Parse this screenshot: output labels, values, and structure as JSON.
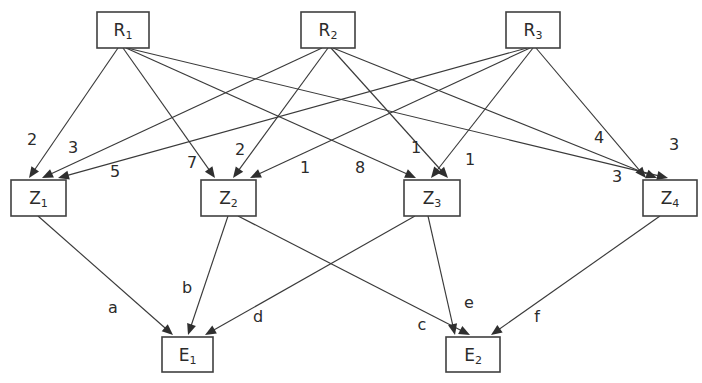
{
  "diagram": {
    "canvas": {
      "width": 702,
      "height": 383
    },
    "colors": {
      "background": "#ffffff",
      "node_stroke": "#404040",
      "node_fill": "#ffffff",
      "edge": "#3a3a3a",
      "text": "#2b2b2b"
    },
    "nodes": [
      {
        "id": "R1",
        "base": "R",
        "sub": "1",
        "layer": "input",
        "x": 97,
        "y": 12,
        "w": 52,
        "h": 36
      },
      {
        "id": "R2",
        "base": "R",
        "sub": "2",
        "layer": "input",
        "x": 301,
        "y": 12,
        "w": 54,
        "h": 36
      },
      {
        "id": "R3",
        "base": "R",
        "sub": "3",
        "layer": "input",
        "x": 506,
        "y": 12,
        "w": 54,
        "h": 36
      },
      {
        "id": "Z1",
        "base": "Z",
        "sub": "1",
        "layer": "hidden",
        "x": 11,
        "y": 180,
        "w": 55,
        "h": 36
      },
      {
        "id": "Z2",
        "base": "Z",
        "sub": "2",
        "layer": "hidden",
        "x": 201,
        "y": 180,
        "w": 55,
        "h": 36
      },
      {
        "id": "Z3",
        "base": "Z",
        "sub": "3",
        "layer": "hidden",
        "x": 404,
        "y": 180,
        "w": 56,
        "h": 36
      },
      {
        "id": "Z4",
        "base": "Z",
        "sub": "4",
        "layer": "hidden",
        "x": 643,
        "y": 180,
        "w": 54,
        "h": 36
      },
      {
        "id": "E1",
        "base": "E",
        "sub": "1",
        "layer": "output",
        "x": 162,
        "y": 337,
        "w": 51,
        "h": 35
      },
      {
        "id": "E2",
        "base": "E",
        "sub": "2",
        "layer": "output",
        "x": 446,
        "y": 337,
        "w": 54,
        "h": 35
      }
    ],
    "edges": [
      {
        "from": "R1",
        "to": "Z1",
        "label": "2",
        "x1": 118,
        "y1": 48,
        "x2": 29,
        "y2": 178,
        "lx": 32,
        "ly": 140
      },
      {
        "from": "R1",
        "to": "Z2",
        "label": "7",
        "x1": 123,
        "y1": 48,
        "x2": 215,
        "y2": 178,
        "lx": 192,
        "ly": 163
      },
      {
        "from": "R1",
        "to": "Z3",
        "label": "1",
        "x1": 126,
        "y1": 48,
        "x2": 416,
        "y2": 178,
        "lx": 416,
        "ly": 148
      },
      {
        "from": "R1",
        "to": "Z4",
        "label": "3",
        "x1": 127,
        "y1": 48,
        "x2": 668,
        "y2": 178,
        "lx": 674,
        "ly": 145
      },
      {
        "from": "R2",
        "to": "Z1",
        "label": "3",
        "x1": 322,
        "y1": 48,
        "x2": 42,
        "y2": 178,
        "lx": 73,
        "ly": 148
      },
      {
        "from": "R2",
        "to": "Z2",
        "label": "2",
        "x1": 328,
        "y1": 48,
        "x2": 233,
        "y2": 178,
        "lx": 240,
        "ly": 150
      },
      {
        "from": "R2",
        "to": "Z3",
        "label": "1",
        "x1": 331,
        "y1": 48,
        "x2": 448,
        "y2": 178,
        "lx": 470,
        "ly": 160
      },
      {
        "from": "R2",
        "to": "Z4",
        "label": "4",
        "x1": 333,
        "y1": 48,
        "x2": 657,
        "y2": 178,
        "lx": 599,
        "ly": 138
      },
      {
        "from": "R3",
        "to": "Z1",
        "label": "5",
        "x1": 527,
        "y1": 48,
        "x2": 58,
        "y2": 178,
        "lx": 115,
        "ly": 172
      },
      {
        "from": "R3",
        "to": "Z2",
        "label": "1",
        "x1": 530,
        "y1": 48,
        "x2": 250,
        "y2": 178,
        "lx": 305,
        "ly": 168
      },
      {
        "from": "R3",
        "to": "Z3",
        "label": "8",
        "x1": 533,
        "y1": 48,
        "x2": 431,
        "y2": 178,
        "lx": 360,
        "ly": 168
      },
      {
        "from": "R3",
        "to": "Z4",
        "label": "3",
        "x1": 536,
        "y1": 48,
        "x2": 646,
        "y2": 178,
        "lx": 617,
        "ly": 177
      },
      {
        "from": "Z1",
        "to": "E1",
        "label": "a",
        "x1": 38,
        "y1": 216,
        "x2": 173,
        "y2": 335,
        "lx": 113,
        "ly": 308
      },
      {
        "from": "Z2",
        "to": "E1",
        "label": "b",
        "x1": 228,
        "y1": 216,
        "x2": 188,
        "y2": 335,
        "lx": 187,
        "ly": 288
      },
      {
        "from": "Z2",
        "to": "E2",
        "label": "e",
        "x1": 238,
        "y1": 216,
        "x2": 470,
        "y2": 335,
        "lx": 469,
        "ly": 303
      },
      {
        "from": "Z3",
        "to": "E1",
        "label": "d",
        "x1": 415,
        "y1": 216,
        "x2": 205,
        "y2": 335,
        "lx": 258,
        "ly": 317
      },
      {
        "from": "Z3",
        "to": "E2",
        "label": "c",
        "x1": 428,
        "y1": 216,
        "x2": 455,
        "y2": 335,
        "lx": 422,
        "ly": 325
      },
      {
        "from": "Z4",
        "to": "E2",
        "label": "f",
        "x1": 660,
        "y1": 216,
        "x2": 491,
        "y2": 335,
        "lx": 537,
        "ly": 317
      }
    ],
    "legend_note": ""
  }
}
